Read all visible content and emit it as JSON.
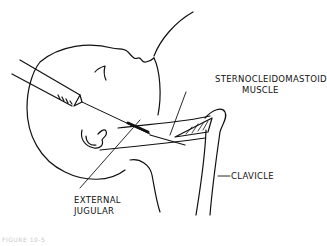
{
  "figure": {
    "labels": {
      "sternocleidomastoid_line1": "STERNOCLEIDOMASTOID",
      "sternocleidomastoid_line2": "MUSCLE",
      "clavicle": "CLAVICLE",
      "external_line1": "EXTERNAL",
      "external_line2": "JUGULAR"
    },
    "caption": "FIGURE 10-5",
    "colors": {
      "ink": "#111111",
      "background": "#ffffff",
      "caption": "#c8c8c8"
    }
  }
}
